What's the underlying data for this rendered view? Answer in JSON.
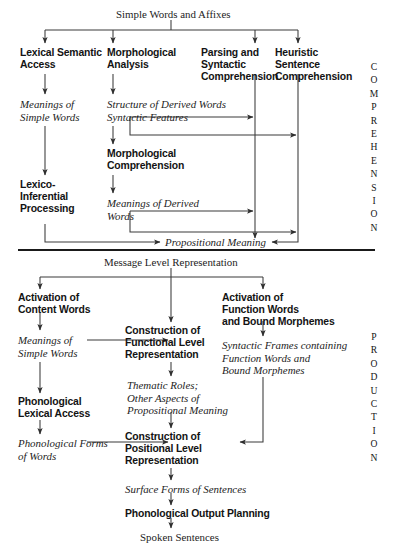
{
  "diagram": {
    "sections": [
      {
        "id": "comprehension",
        "label": "COMPREHENSION"
      },
      {
        "id": "production",
        "label": "PRODUCTION"
      }
    ],
    "comprehension": {
      "input": "Simple Words and Affixes",
      "columns": [
        {
          "id": "lexical-semantic-access",
          "label": "Lexical Semantic\nAccess",
          "style": "bold"
        },
        {
          "id": "morphological-analysis",
          "label": "Morphological\nAnalysis",
          "style": "bold"
        },
        {
          "id": "parsing-and-syntactic-comprehension",
          "label": "Parsing and\nSyntactic\nComprehension",
          "style": "bold"
        },
        {
          "id": "heuristic-sentence-comprehension",
          "label": "Heuristic\nSentence\nComprehension",
          "style": "bold"
        }
      ],
      "nodes": [
        {
          "id": "meanings-of-simple-words",
          "label": "Meanings of\nSimple Words",
          "style": "italic"
        },
        {
          "id": "structure-of-derived-words",
          "label": "Structure of Derived Words\nSyntactic Features",
          "style": "italic"
        },
        {
          "id": "morphological-comprehension",
          "label": "Morphological\nComprehension",
          "style": "bold"
        },
        {
          "id": "lexico-inferential-processing",
          "label": "Lexico-\nInferential\nProcessing",
          "style": "bold"
        },
        {
          "id": "meanings-of-derived-words",
          "label": "Meanings of Derived\nWords",
          "style": "italic"
        },
        {
          "id": "propositional-meaning",
          "label": "Propositional Meaning",
          "style": "italic"
        }
      ]
    },
    "production": {
      "input": "Message Level Representation",
      "columns": [
        {
          "id": "activation-of-content-words",
          "label": "Activation of\nContent Words",
          "style": "bold"
        },
        {
          "id": "activation-of-function-words",
          "label": "Activation of\nFunction Words\nand Bound Morphemes",
          "style": "bold"
        }
      ],
      "nodes": [
        {
          "id": "meanings-of-simple-words-prod",
          "label": "Meanings of\nSimple Words",
          "style": "italic"
        },
        {
          "id": "construction-of-functional-level-representation",
          "label": "Construction of\nFunctional Level\nRepresentation",
          "style": "bold"
        },
        {
          "id": "thematic-roles",
          "label": "Thematic Roles;\nOther Aspects of\nPropositional Meaning",
          "style": "italic"
        },
        {
          "id": "syntactic-frames",
          "label": "Syntactic Frames containing\nFunction Words and\nBound Morphemes",
          "style": "italic"
        },
        {
          "id": "phonological-lexical-access",
          "label": "Phonological\nLexical Access",
          "style": "bold"
        },
        {
          "id": "phonological-forms-of-words",
          "label": "Phonological Forms\nof Words",
          "style": "italic"
        },
        {
          "id": "construction-of-positional-level-representation",
          "label": "Construction of\nPositional Level\nRepresentation",
          "style": "bold"
        },
        {
          "id": "surface-forms-of-sentences",
          "label": "Surface Forms of Sentences",
          "style": "italic"
        },
        {
          "id": "phonological-output-planning",
          "label": "Phonological Output Planning",
          "style": "bold"
        },
        {
          "id": "spoken-sentences",
          "label": "Spoken Sentences",
          "style": "plain"
        }
      ]
    },
    "colors": {
      "ink": "#131313",
      "line": "#3a3a3a",
      "background": "#ffffff"
    }
  }
}
